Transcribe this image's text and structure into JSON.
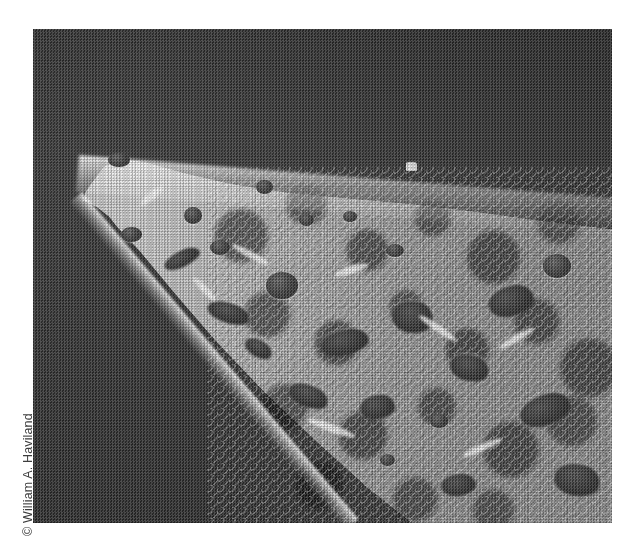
{
  "page": {
    "background_color": "#ffffff",
    "width": 635,
    "height": 551
  },
  "credit": {
    "text": "© William A. Haviland",
    "symbol": "©",
    "name": "William A. Haviland",
    "orientation": "rotated-90-ccw",
    "color": "#3d3d3d"
  },
  "figure": {
    "type": "photograph",
    "medium": "scanning electron micrograph",
    "rendering": "halftone black-and-white print scan",
    "caption": "",
    "colors": {
      "background": "#373737",
      "specimen_light": "#c8c8c8",
      "specimen_mid": "#9b9b9b",
      "pore_dark": "#2f2f2f",
      "highlight": "#f2f2f2"
    },
    "bounds": {
      "left": 33,
      "top": 29,
      "width": 579,
      "height": 494
    },
    "features": [
      {
        "name": "tip",
        "position": "left",
        "description": "sharp pointed apex"
      },
      {
        "name": "top-ridge",
        "position": "upper",
        "description": "bright highlighted dorsal edge rising to the right"
      },
      {
        "name": "fracture-edge",
        "position": "lower-left",
        "description": "bright diagonal broken margin"
      },
      {
        "name": "porous-field",
        "position": "right",
        "description": "lacy trabecular network with many voids"
      },
      {
        "name": "ridge-speck",
        "position": "upper-center-right",
        "description": "small bright particle on the ridge"
      }
    ],
    "pores": [
      {
        "x": 38.5,
        "y": 30.5,
        "w": 3.0,
        "h": 3.0,
        "shape": "round"
      },
      {
        "x": 26.0,
        "y": 36.0,
        "w": 3.2,
        "h": 3.4,
        "shape": "round"
      },
      {
        "x": 30.6,
        "y": 42.8,
        "w": 3.4,
        "h": 3.0,
        "shape": "round"
      },
      {
        "x": 40.2,
        "y": 49.2,
        "w": 5.6,
        "h": 5.4,
        "shape": "round"
      },
      {
        "x": 15.2,
        "y": 40.0,
        "w": 3.6,
        "h": 3.2,
        "shape": "round"
      },
      {
        "x": 13.0,
        "y": 25.0,
        "w": 3.8,
        "h": 3.0,
        "shape": "round"
      },
      {
        "x": 46.0,
        "y": 37.5,
        "w": 2.6,
        "h": 2.4,
        "shape": "round"
      },
      {
        "x": 53.5,
        "y": 36.8,
        "w": 2.4,
        "h": 2.2,
        "shape": "round"
      },
      {
        "x": 61.0,
        "y": 43.5,
        "w": 3.0,
        "h": 2.6,
        "shape": "round"
      },
      {
        "x": 88.0,
        "y": 45.5,
        "w": 5.0,
        "h": 5.0,
        "shape": "round"
      },
      {
        "x": 68.5,
        "y": 78.0,
        "w": 3.2,
        "h": 2.8,
        "shape": "round"
      },
      {
        "x": 60.0,
        "y": 86.0,
        "w": 2.6,
        "h": 2.4,
        "shape": "round"
      }
    ],
    "voids": [
      {
        "x": 22.5,
        "y": 45.0,
        "w": 6.5,
        "h": 3.2,
        "rot": -26
      },
      {
        "x": 30.0,
        "y": 55.5,
        "w": 7.5,
        "h": 4.0,
        "rot": 18
      },
      {
        "x": 49.5,
        "y": 61.0,
        "w": 8.5,
        "h": 5.0,
        "rot": -12
      },
      {
        "x": 62.0,
        "y": 55.0,
        "w": 7.0,
        "h": 6.5,
        "rot": 8
      },
      {
        "x": 78.5,
        "y": 52.0,
        "w": 8.0,
        "h": 6.0,
        "rot": -16
      },
      {
        "x": 44.0,
        "y": 72.0,
        "w": 7.0,
        "h": 4.4,
        "rot": 22
      },
      {
        "x": 56.5,
        "y": 74.0,
        "w": 6.0,
        "h": 4.8,
        "rot": -8
      },
      {
        "x": 72.0,
        "y": 66.0,
        "w": 6.8,
        "h": 5.2,
        "rot": 14
      },
      {
        "x": 84.0,
        "y": 74.0,
        "w": 9.0,
        "h": 6.0,
        "rot": -20
      },
      {
        "x": 90.0,
        "y": 88.0,
        "w": 8.0,
        "h": 6.5,
        "rot": 10
      },
      {
        "x": 70.5,
        "y": 90.0,
        "w": 6.0,
        "h": 4.5,
        "rot": -6
      },
      {
        "x": 36.5,
        "y": 63.0,
        "w": 5.0,
        "h": 3.4,
        "rot": 30
      }
    ],
    "flecks": [
      {
        "x": 18.0,
        "y": 33.0,
        "w": 5.0,
        "h": 1.6,
        "rot": -40
      },
      {
        "x": 34.0,
        "y": 45.0,
        "w": 7.0,
        "h": 1.4,
        "rot": 28
      },
      {
        "x": 52.0,
        "y": 48.0,
        "w": 6.0,
        "h": 1.6,
        "rot": -18
      },
      {
        "x": 66.0,
        "y": 60.0,
        "w": 8.0,
        "h": 1.5,
        "rot": 34
      },
      {
        "x": 80.0,
        "y": 62.0,
        "w": 7.0,
        "h": 1.4,
        "rot": -30
      },
      {
        "x": 47.0,
        "y": 80.0,
        "w": 9.0,
        "h": 1.6,
        "rot": 20
      },
      {
        "x": 74.0,
        "y": 84.0,
        "w": 7.5,
        "h": 1.5,
        "rot": -24
      },
      {
        "x": 27.0,
        "y": 52.0,
        "w": 5.5,
        "h": 1.4,
        "rot": 46
      }
    ]
  }
}
